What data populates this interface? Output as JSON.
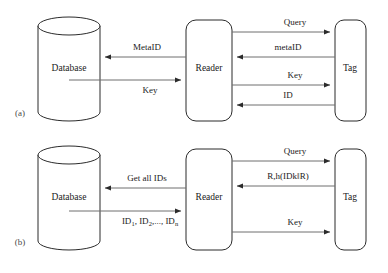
{
  "figure": {
    "type": "protocol-flow-diagram",
    "panels": [
      {
        "marker": "(a)",
        "nodes": [
          {
            "id": "database",
            "label": "Database",
            "shape": "cylinder"
          },
          {
            "id": "reader",
            "label": "Reader",
            "shape": "rounded-rect"
          },
          {
            "id": "tag",
            "label": "Tag",
            "shape": "rounded-rect"
          }
        ],
        "edges": [
          {
            "label": "MetaID",
            "from": "reader",
            "to": "database",
            "direction": "left"
          },
          {
            "label": "Key",
            "from": "database",
            "to": "reader",
            "direction": "right"
          },
          {
            "label": "Query",
            "from": "reader",
            "to": "tag",
            "direction": "right"
          },
          {
            "label": "metaID",
            "from": "tag",
            "to": "reader",
            "direction": "left"
          },
          {
            "label": "Key",
            "from": "reader",
            "to": "tag",
            "direction": "right"
          },
          {
            "label": "ID",
            "from": "tag",
            "to": "reader",
            "direction": "left"
          }
        ]
      },
      {
        "marker": "(b)",
        "nodes": [
          {
            "id": "database",
            "label": "Database",
            "shape": "cylinder"
          },
          {
            "id": "reader",
            "label": "Reader",
            "shape": "rounded-rect"
          },
          {
            "id": "tag",
            "label": "Tag",
            "shape": "rounded-rect"
          }
        ],
        "edges": [
          {
            "label": "Get all IDs",
            "from": "reader",
            "to": "database",
            "direction": "left"
          },
          {
            "label": "ID1, ID2,..., IDn",
            "from": "database",
            "to": "reader",
            "direction": "right"
          },
          {
            "label": "Query",
            "from": "reader",
            "to": "tag",
            "direction": "right"
          },
          {
            "label": "R,h(IDk‖R)",
            "from": "tag",
            "to": "reader",
            "direction": "left"
          },
          {
            "label": "Key",
            "from": "reader",
            "to": "tag",
            "direction": "right"
          }
        ]
      }
    ],
    "id_list_parts": {
      "p1": "ID",
      "s1": "1",
      "p2": ", ID",
      "s2": "2",
      "p3": ",..., ID",
      "s3": "n"
    },
    "colors": {
      "stroke": "#2b2b2b",
      "arrow": "#6e6e6e",
      "text": "#1a1a1a",
      "background": "#ffffff"
    }
  }
}
